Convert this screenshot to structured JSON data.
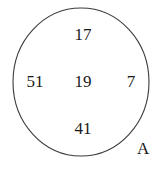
{
  "figure": {
    "type": "venn-single-set-diagram",
    "set_name": "A",
    "shape": "circle",
    "background_color": "#ffffff",
    "stroke_color": "#3c3c3c",
    "text_color": "#1a1a1a",
    "elements": {
      "top": "17",
      "left": "51",
      "center": "19",
      "right": "7",
      "bottom": "41"
    },
    "members": [
      "17",
      "51",
      "19",
      "7",
      "41"
    ]
  }
}
